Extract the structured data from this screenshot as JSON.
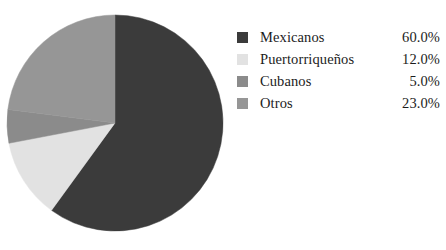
{
  "chart_data": {
    "type": "pie",
    "title": "",
    "subtitle": "",
    "xlabel": "",
    "ylabel": "",
    "legend_position": "right",
    "grid": false,
    "start_angle_deg": 0,
    "direction": "clockwise",
    "categories": [
      "Mexicanos",
      "Puertorriqueños",
      "Cubanos",
      "Otros"
    ],
    "values": [
      60.0,
      12.0,
      5.0,
      23.0
    ],
    "value_labels": [
      "60.0%",
      "12.0%",
      "5.0%",
      "23.0%"
    ],
    "colors": [
      "#3b3b3b",
      "#e2e2e2",
      "#8b8b8b",
      "#969696"
    ],
    "slices": [
      {
        "label": "Mexicanos",
        "value": 60.0,
        "display": "60.0%",
        "color": "#3b3b3b",
        "start_deg": 0.0,
        "end_deg": 216.0
      },
      {
        "label": "Puertorriqueños",
        "value": 12.0,
        "display": "12.0%",
        "color": "#e2e2e2",
        "start_deg": 216.0,
        "end_deg": 259.2
      },
      {
        "label": "Cubanos",
        "value": 5.0,
        "display": "5.0%",
        "color": "#8b8b8b",
        "start_deg": 259.2,
        "end_deg": 277.2
      },
      {
        "label": "Otros",
        "value": 23.0,
        "display": "23.0%",
        "color": "#969696",
        "start_deg": 277.2,
        "end_deg": 360.0
      }
    ]
  },
  "pie": {
    "center_x": 115,
    "center_y": 123,
    "radius": 108
  },
  "legend": {
    "rows": [
      {
        "label": "Mexicanos",
        "value": "60.0%",
        "color": "#3b3b3b",
        "swatch_name": "legend-swatch-mexicanos"
      },
      {
        "label": "Puertorriqueños",
        "value": "12.0%",
        "color": "#e2e2e2",
        "swatch_name": "legend-swatch-puertorriquenos"
      },
      {
        "label": "Cubanos",
        "value": "5.0%",
        "color": "#8b8b8b",
        "swatch_name": "legend-swatch-cubanos"
      },
      {
        "label": "Otros",
        "value": "23.0%",
        "color": "#969696",
        "swatch_name": "legend-swatch-otros"
      }
    ]
  }
}
